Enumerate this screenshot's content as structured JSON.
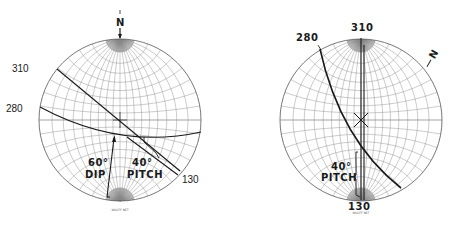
{
  "figure": {
    "type": "stereographic projections (Wulff net)",
    "panels": [
      {
        "id": "left",
        "net_label": "WULFF NET",
        "north_label": "N",
        "south_tick": "s",
        "center": [
          120,
          120
        ],
        "radius": 81,
        "strike_labels": [
          {
            "text": "310",
            "x": 12,
            "y": 70
          },
          {
            "text": "280",
            "x": 6,
            "y": 110
          },
          {
            "text": "130",
            "x": 182,
            "y": 181
          }
        ],
        "annotations": {
          "dip_value": "60°",
          "dip_label": "DIP",
          "pitch_value": "40°",
          "pitch_label": "PITCH"
        }
      },
      {
        "id": "right",
        "net_label": "WULFF NET",
        "north_label": "N",
        "center": [
          361,
          120
        ],
        "radius": 81,
        "strike_labels": [
          {
            "text": "310",
            "x": 351,
            "y": 30
          },
          {
            "text": "280",
            "x": 296,
            "y": 40
          },
          {
            "text": "130",
            "x": 349,
            "y": 210
          }
        ],
        "annotations": {
          "pitch_value": "40°",
          "pitch_label": "PITCH"
        }
      }
    ]
  }
}
